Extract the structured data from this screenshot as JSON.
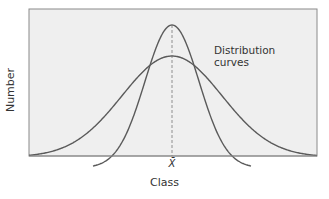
{
  "chart_data": {
    "type": "line",
    "title": "",
    "xlabel": "Class",
    "ylabel": "Number",
    "x_tick_labels": [
      "X̄"
    ],
    "annotation": "Distribution curves",
    "annotation_lines": [
      "Distribution",
      "curves"
    ],
    "mean_line": {
      "x": "X̄",
      "style": "dashed"
    },
    "grid": false,
    "legend": null,
    "series": [
      {
        "name": "Narrow distribution curve",
        "center": 0,
        "relative_spread": 0.55,
        "relative_peak": 1.0
      },
      {
        "name": "Wide distribution curve",
        "center": 0,
        "relative_spread": 1.0,
        "relative_peak": 0.77
      }
    ],
    "colors": {
      "frame_fill": "#efefef",
      "frame_border": "#8a8a8a",
      "curve": "#5a5a5a",
      "mean_line": "#777777"
    }
  },
  "labels": {
    "ylabel": "Number",
    "xlabel": "Class",
    "xmean": "X̄",
    "annotation_line1": "Distribution",
    "annotation_line2": "curves"
  }
}
